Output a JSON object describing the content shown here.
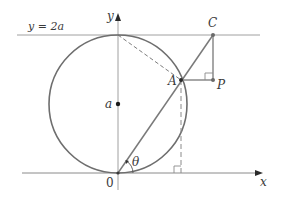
{
  "figure": {
    "labels": {
      "y_axis": "y",
      "x_axis": "x",
      "horizontal_line": "y = 2a",
      "point_C": "C",
      "point_A": "A",
      "point_P": "P",
      "center": "a",
      "origin": "0",
      "angle": "θ"
    },
    "colors": {
      "circle": "#6e6e6e",
      "axes": "#9a9a9a",
      "lines": "#8a8a8a",
      "dots": "#2a2a2a"
    },
    "elements": {
      "circle": {
        "cx": 118,
        "cy": 104,
        "r": 69
      },
      "line_y2a": {
        "y": 35,
        "x1": 17,
        "x2": 260
      },
      "x_axis": {
        "y": 173,
        "x1": 22,
        "x2": 263
      },
      "y_axis": {
        "x": 118,
        "y1": 13,
        "y2": 190
      },
      "points": {
        "O": [
          118,
          173
        ],
        "A": [
          181,
          80
        ],
        "C": [
          213,
          35
        ],
        "P": [
          213,
          80
        ],
        "center": [
          118,
          104
        ]
      }
    }
  }
}
